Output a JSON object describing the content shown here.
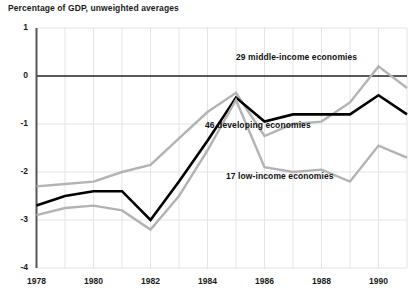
{
  "chart_data": {
    "type": "line",
    "title": "Percentage of GDP, unweighted averages",
    "xlabel": "",
    "ylabel": "",
    "xlim": [
      1978,
      1991
    ],
    "ylim": [
      -4,
      1
    ],
    "yticks": [
      1,
      0,
      -1,
      -2,
      -3,
      -4
    ],
    "ytick_labels": [
      "1",
      "0",
      "-1",
      "-2",
      "-3",
      "-4"
    ],
    "xticks": [
      1978,
      1980,
      1982,
      1984,
      1986,
      1988,
      1990
    ],
    "xtick_labels": [
      "1978",
      "1980",
      "1982",
      "1984",
      "1986",
      "1988",
      "1990"
    ],
    "x": [
      1978,
      1979,
      1980,
      1981,
      1982,
      1983,
      1984,
      1985,
      1986,
      1987,
      1988,
      1989,
      1990,
      1991
    ],
    "grid": true,
    "legend_position": "inline-annotations",
    "zero_line": true,
    "series": [
      {
        "name": "29 middle-income economies",
        "color": "#b3b3b3",
        "width": 2.4,
        "values": [
          -2.3,
          -2.25,
          -2.2,
          -2.0,
          -1.85,
          -1.3,
          -0.75,
          -0.35,
          -1.25,
          -1.0,
          -0.95,
          -0.55,
          0.2,
          -0.25
        ]
      },
      {
        "name": "46 developing economies",
        "color": "#000000",
        "width": 2.6,
        "values": [
          -2.7,
          -2.5,
          -2.4,
          -2.4,
          -3.0,
          -2.2,
          -1.35,
          -0.45,
          -0.95,
          -0.8,
          -0.8,
          -0.8,
          -0.4,
          -0.8
        ]
      },
      {
        "name": "17 low-income economies",
        "color": "#b3b3b3",
        "width": 2.4,
        "values": [
          -2.9,
          -2.75,
          -2.7,
          -2.8,
          -3.2,
          -2.5,
          -1.55,
          -0.5,
          -1.9,
          -2.0,
          -1.95,
          -2.2,
          -1.45,
          -1.7
        ]
      }
    ],
    "annotations": [
      {
        "text": "29 middle-income economies",
        "x_px": 236,
        "y_px": 52
      },
      {
        "text": "46 developing economies",
        "x_px": 205,
        "y_px": 120
      },
      {
        "text": "17 low-income economies",
        "x_px": 226,
        "y_px": 171
      }
    ]
  }
}
